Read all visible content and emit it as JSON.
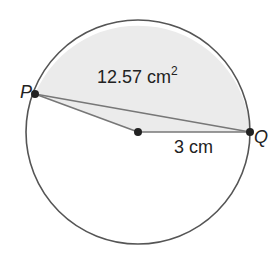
{
  "diagram": {
    "type": "circle-sector",
    "center": {
      "x": 138,
      "y": 132
    },
    "radius": 112,
    "points": {
      "P": {
        "label": "P",
        "x": 35,
        "y": 94
      },
      "Q": {
        "label": "Q",
        "x": 250,
        "y": 132
      }
    },
    "labels": {
      "area_value": "12.57 cm",
      "area_exponent": "2",
      "radius_label": "3 cm"
    },
    "colors": {
      "shade": "#ebebeb",
      "stroke": "#555555",
      "line": "#777777",
      "dot": "#222222"
    }
  }
}
